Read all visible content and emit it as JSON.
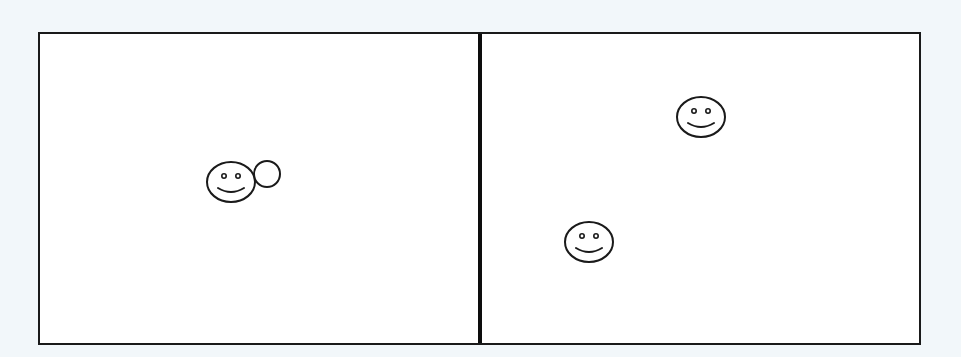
{
  "figure": {
    "background_color": "#f2f7fa",
    "panel_fill": "#ffffff",
    "stroke_color": "#1a1a1a",
    "divider_color": "#0d0d0d",
    "panels": [
      {
        "id": "left",
        "smileys": [
          {
            "cx": 231,
            "cy": 182,
            "rx": 24,
            "ry": 20
          }
        ],
        "circles": [
          {
            "cx": 267,
            "cy": 174,
            "r": 13
          }
        ]
      },
      {
        "id": "right",
        "smileys": [
          {
            "cx": 701,
            "cy": 117,
            "rx": 24,
            "ry": 20
          },
          {
            "cx": 589,
            "cy": 242,
            "rx": 24,
            "ry": 20
          }
        ],
        "circles": []
      }
    ]
  }
}
